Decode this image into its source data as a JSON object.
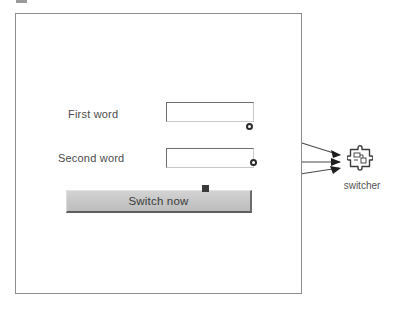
{
  "diagram": {
    "type": "ui-builder-canvas"
  },
  "form_panel": {
    "name": "form-container",
    "fields": [
      {
        "label": "First word",
        "value": "",
        "placeholder": "",
        "field_name": "first-word-input"
      },
      {
        "label": "Second word",
        "value": "",
        "placeholder": "",
        "field_name": "second-word-input"
      }
    ],
    "button": {
      "label": "Switch now",
      "name": "switch-now-button"
    }
  },
  "bean": {
    "label": "switcher",
    "icon": "puzzle-piece-icon"
  },
  "connections": [
    {
      "from": "first-word-input",
      "to": "switcher",
      "anchor": "circle"
    },
    {
      "from": "second-word-input",
      "to": "switcher",
      "anchor": "circle"
    },
    {
      "from": "switch-now-button",
      "to": "switcher",
      "anchor": "square"
    }
  ],
  "colors": {
    "panel_border": "#8d8d8d",
    "button_face": "#c6c6c6",
    "wire": "#4a4a4a",
    "text": "#4b4b4b"
  }
}
